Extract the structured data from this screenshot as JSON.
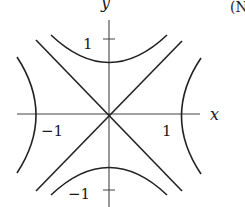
{
  "diagram": {
    "type": "hyperbolas-with-asymptotes",
    "axes": {
      "x_label": "x",
      "y_label": "y"
    },
    "ticks": {
      "x_pos": "1",
      "x_neg": "−1",
      "y_pos": "1",
      "y_neg": "−1"
    },
    "corner_text": "(N",
    "colors": {
      "stroke": "#222222",
      "axis": "#444444",
      "background": "#ffffff"
    }
  }
}
